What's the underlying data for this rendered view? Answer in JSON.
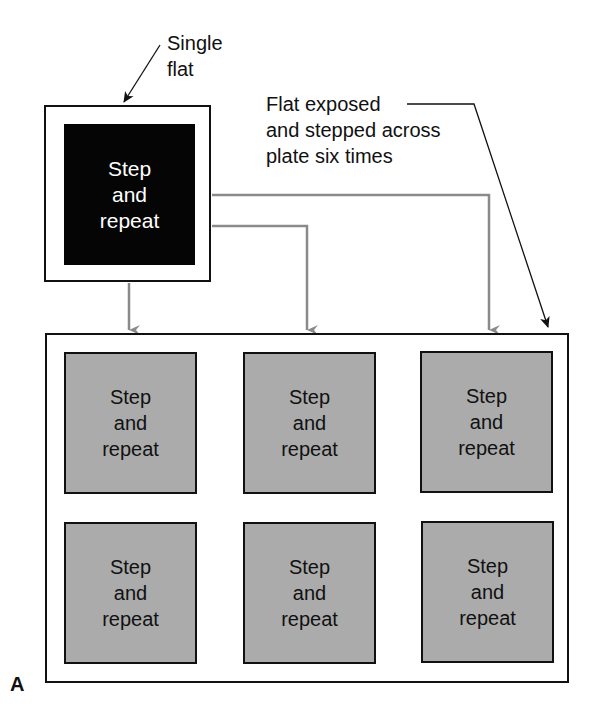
{
  "figure_label": "A",
  "source_flat": {
    "callout": "Single\nflat",
    "text": "Step\nand\nrepeat",
    "fill_color": "#050505"
  },
  "annotation": {
    "text": "Flat exposed\nand stepped across\nplate six times"
  },
  "plate": {
    "tiles": [
      {
        "text": "Step\nand\nrepeat"
      },
      {
        "text": "Step\nand\nrepeat"
      },
      {
        "text": "Step\nand\nrepeat"
      },
      {
        "text": "Step\nand\nrepeat"
      },
      {
        "text": "Step\nand\nrepeat"
      },
      {
        "text": "Step\nand\nrepeat"
      }
    ],
    "tile_color": "#ababab",
    "connector_color": "#8a8a8a"
  }
}
